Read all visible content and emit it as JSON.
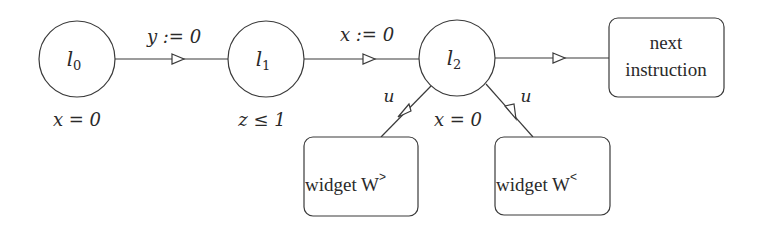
{
  "diagram": {
    "type": "timed-automaton-gadget",
    "nodes": [
      {
        "id": "l0",
        "kind": "location",
        "label_base": "l",
        "label_sub": "0",
        "invariant": "x = 0"
      },
      {
        "id": "l1",
        "kind": "location",
        "label_base": "l",
        "label_sub": "1",
        "invariant": "z ≤ 1"
      },
      {
        "id": "l2",
        "kind": "location",
        "label_base": "l",
        "label_sub": "2",
        "invariant": "x = 0"
      },
      {
        "id": "next",
        "kind": "box",
        "label_line1": "next",
        "label_line2": "instruction"
      },
      {
        "id": "wgt",
        "kind": "box",
        "label": "widget W",
        "label_sup": ">"
      },
      {
        "id": "wlt",
        "kind": "box",
        "label": "widget W",
        "label_sup": "<"
      }
    ],
    "edges": [
      {
        "from": "l0",
        "to": "l1",
        "label": "y := 0"
      },
      {
        "from": "l1",
        "to": "l2",
        "label": "x := 0"
      },
      {
        "from": "l2",
        "to": "next",
        "label": ""
      },
      {
        "from": "l2",
        "to": "wgt",
        "label": "u"
      },
      {
        "from": "l2",
        "to": "wlt",
        "label": "u"
      }
    ]
  }
}
